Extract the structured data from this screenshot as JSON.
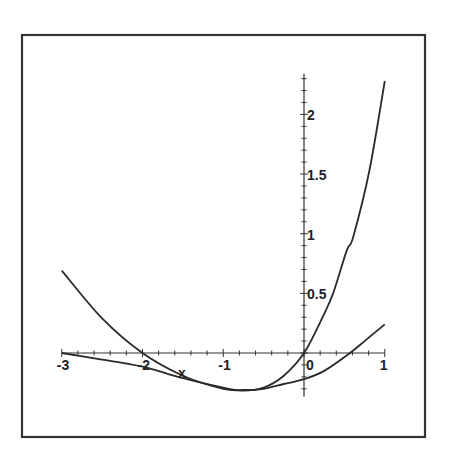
{
  "chart_data": {
    "type": "line",
    "title": "",
    "xlabel": "x",
    "ylabel": "",
    "xlim": [
      -3,
      1
    ],
    "ylim": [
      -0.35,
      2.34
    ],
    "grid": false,
    "legend": null,
    "x_ticks": [
      -3,
      -2,
      -1,
      0,
      1
    ],
    "x_tick_labels": [
      "-3",
      "-2",
      "-1",
      "0",
      "1"
    ],
    "x_minor_step": 0.2,
    "y_ticks": [
      0.5,
      1,
      1.5,
      2
    ],
    "y_tick_labels": [
      "0.5",
      "1",
      "1.5",
      "2"
    ],
    "y_minor_step": 0.1,
    "series": [
      {
        "name": "curve-steep",
        "x": [
          -3,
          -2.5,
          -2,
          -1.5,
          -1,
          -0.75,
          -0.5,
          -0.25,
          0,
          0.23,
          0.36,
          0.53,
          0.61,
          0.81,
          1
        ],
        "y": [
          0,
          -0.055,
          -0.115,
          -0.21,
          -0.29,
          -0.315,
          -0.29,
          -0.19,
          0,
          0.3,
          0.5,
          0.86,
          0.975,
          1.53,
          2.28
        ]
      },
      {
        "name": "parabola",
        "x": [
          -3,
          -2.5,
          -2,
          -1.5,
          -1,
          -0.75,
          -0.5,
          -0.25,
          0,
          0.25,
          0.57,
          0.75,
          1
        ],
        "y": [
          0.69,
          0.29,
          0,
          -0.19,
          -0.3,
          -0.31,
          -0.3,
          -0.26,
          -0.22,
          -0.15,
          0,
          0.1,
          0.24
        ]
      }
    ]
  },
  "axis_label_x": "x"
}
